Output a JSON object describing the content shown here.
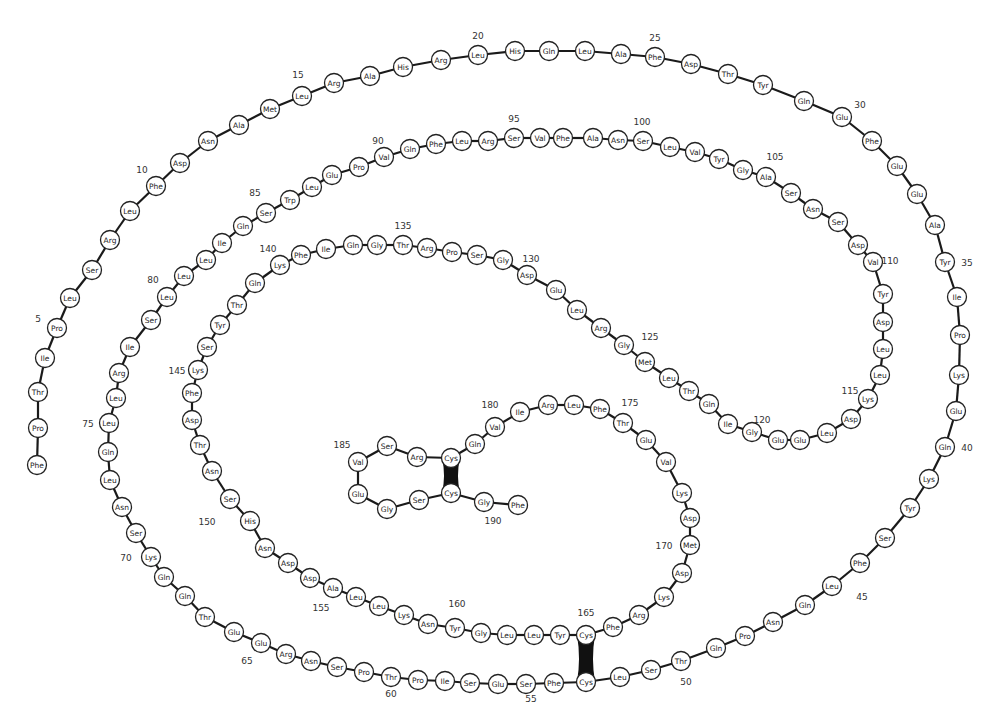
{
  "colors": {
    "ink": "#222222",
    "bond": "#1a1a1a",
    "circle_fill": "#ffffff",
    "disulfide": "#111111"
  },
  "circle_radius": 9.5,
  "residues": [
    {
      "n": 1,
      "aa": "Phe",
      "x": 37,
      "y": 465
    },
    {
      "n": 2,
      "aa": "Pro",
      "x": 38,
      "y": 428
    },
    {
      "n": 3,
      "aa": "Thr",
      "x": 38,
      "y": 392
    },
    {
      "n": 4,
      "aa": "Ile",
      "x": 45,
      "y": 358
    },
    {
      "n": 5,
      "aa": "Pro",
      "x": 57,
      "y": 328
    },
    {
      "n": 6,
      "aa": "Leu",
      "x": 70,
      "y": 298
    },
    {
      "n": 7,
      "aa": "Ser",
      "x": 92,
      "y": 270
    },
    {
      "n": 8,
      "aa": "Arg",
      "x": 110,
      "y": 240
    },
    {
      "n": 9,
      "aa": "Leu",
      "x": 130,
      "y": 211
    },
    {
      "n": 10,
      "aa": "Phe",
      "x": 156,
      "y": 186
    },
    {
      "n": 11,
      "aa": "Asp",
      "x": 180,
      "y": 163
    },
    {
      "n": 12,
      "aa": "Asn",
      "x": 208,
      "y": 141
    },
    {
      "n": 13,
      "aa": "Ala",
      "x": 239,
      "y": 125
    },
    {
      "n": 14,
      "aa": "Met",
      "x": 270,
      "y": 109
    },
    {
      "n": 15,
      "aa": "Leu",
      "x": 302,
      "y": 96
    },
    {
      "n": 16,
      "aa": "Arg",
      "x": 334,
      "y": 83
    },
    {
      "n": 17,
      "aa": "Ala",
      "x": 370,
      "y": 76
    },
    {
      "n": 18,
      "aa": "His",
      "x": 403,
      "y": 67
    },
    {
      "n": 19,
      "aa": "Arg",
      "x": 441,
      "y": 60
    },
    {
      "n": 20,
      "aa": "Leu",
      "x": 478,
      "y": 55
    },
    {
      "n": 21,
      "aa": "His",
      "x": 515,
      "y": 51
    },
    {
      "n": 22,
      "aa": "Gln",
      "x": 549,
      "y": 51
    },
    {
      "n": 23,
      "aa": "Leu",
      "x": 585,
      "y": 51
    },
    {
      "n": 24,
      "aa": "Ala",
      "x": 621,
      "y": 54
    },
    {
      "n": 25,
      "aa": "Phe",
      "x": 655,
      "y": 57
    },
    {
      "n": 26,
      "aa": "Asp",
      "x": 691,
      "y": 64
    },
    {
      "n": 27,
      "aa": "Thr",
      "x": 728,
      "y": 74
    },
    {
      "n": 28,
      "aa": "Tyr",
      "x": 763,
      "y": 85
    },
    {
      "n": 29,
      "aa": "Gln",
      "x": 804,
      "y": 101
    },
    {
      "n": 30,
      "aa": "Glu",
      "x": 842,
      "y": 117
    },
    {
      "n": 31,
      "aa": "Phe",
      "x": 872,
      "y": 141
    },
    {
      "n": 32,
      "aa": "Glu",
      "x": 897,
      "y": 166
    },
    {
      "n": 33,
      "aa": "Glu",
      "x": 917,
      "y": 194
    },
    {
      "n": 34,
      "aa": "Ala",
      "x": 935,
      "y": 225
    },
    {
      "n": 35,
      "aa": "Tyr",
      "x": 945,
      "y": 262
    },
    {
      "n": 36,
      "aa": "Ile",
      "x": 957,
      "y": 297
    },
    {
      "n": 37,
      "aa": "Pro",
      "x": 960,
      "y": 335
    },
    {
      "n": 38,
      "aa": "Lys",
      "x": 959,
      "y": 375
    },
    {
      "n": 39,
      "aa": "Glu",
      "x": 956,
      "y": 411
    },
    {
      "n": 40,
      "aa": "Gln",
      "x": 945,
      "y": 447
    },
    {
      "n": 41,
      "aa": "Lys",
      "x": 929,
      "y": 479
    },
    {
      "n": 42,
      "aa": "Tyr",
      "x": 910,
      "y": 508
    },
    {
      "n": 43,
      "aa": "Ser",
      "x": 885,
      "y": 538
    },
    {
      "n": 44,
      "aa": "Phe",
      "x": 860,
      "y": 563
    },
    {
      "n": 45,
      "aa": "Leu",
      "x": 832,
      "y": 586
    },
    {
      "n": 46,
      "aa": "Gln",
      "x": 805,
      "y": 605
    },
    {
      "n": 47,
      "aa": "Asn",
      "x": 773,
      "y": 622
    },
    {
      "n": 48,
      "aa": "Pro",
      "x": 745,
      "y": 636
    },
    {
      "n": 49,
      "aa": "Gln",
      "x": 716,
      "y": 648
    },
    {
      "n": 50,
      "aa": "Thr",
      "x": 681,
      "y": 661
    },
    {
      "n": 51,
      "aa": "Ser",
      "x": 651,
      "y": 670
    },
    {
      "n": 52,
      "aa": "Leu",
      "x": 620,
      "y": 677
    },
    {
      "n": 53,
      "aa": "Cys",
      "x": 586,
      "y": 682
    },
    {
      "n": 54,
      "aa": "Phe",
      "x": 554,
      "y": 683
    },
    {
      "n": 55,
      "aa": "Ser",
      "x": 526,
      "y": 684
    },
    {
      "n": 56,
      "aa": "Glu",
      "x": 498,
      "y": 684
    },
    {
      "n": 57,
      "aa": "Ser",
      "x": 470,
      "y": 683
    },
    {
      "n": 58,
      "aa": "Ile",
      "x": 445,
      "y": 681
    },
    {
      "n": 59,
      "aa": "Pro",
      "x": 418,
      "y": 680
    },
    {
      "n": 60,
      "aa": "Thr",
      "x": 391,
      "y": 677
    },
    {
      "n": 61,
      "aa": "Pro",
      "x": 364,
      "y": 672
    },
    {
      "n": 62,
      "aa": "Ser",
      "x": 337,
      "y": 667
    },
    {
      "n": 63,
      "aa": "Asn",
      "x": 311,
      "y": 661
    },
    {
      "n": 64,
      "aa": "Arg",
      "x": 286,
      "y": 654
    },
    {
      "n": 65,
      "aa": "Glu",
      "x": 261,
      "y": 643
    },
    {
      "n": 66,
      "aa": "Glu",
      "x": 234,
      "y": 632
    },
    {
      "n": 67,
      "aa": "Thr",
      "x": 205,
      "y": 617
    },
    {
      "n": 68,
      "aa": "Gln",
      "x": 185,
      "y": 596
    },
    {
      "n": 69,
      "aa": "Gln",
      "x": 164,
      "y": 577
    },
    {
      "n": 70,
      "aa": "Lys",
      "x": 151,
      "y": 557
    },
    {
      "n": 71,
      "aa": "Ser",
      "x": 136,
      "y": 533
    },
    {
      "n": 72,
      "aa": "Asn",
      "x": 122,
      "y": 507
    },
    {
      "n": 73,
      "aa": "Leu",
      "x": 110,
      "y": 480
    },
    {
      "n": 74,
      "aa": "Gln",
      "x": 108,
      "y": 452
    },
    {
      "n": 75,
      "aa": "Leu",
      "x": 109,
      "y": 423
    },
    {
      "n": 76,
      "aa": "Leu",
      "x": 116,
      "y": 398
    },
    {
      "n": 77,
      "aa": "Arg",
      "x": 119,
      "y": 373
    },
    {
      "n": 78,
      "aa": "Ile",
      "x": 130,
      "y": 347
    },
    {
      "n": 79,
      "aa": "Ser",
      "x": 151,
      "y": 320
    },
    {
      "n": 80,
      "aa": "Leu",
      "x": 167,
      "y": 297
    },
    {
      "n": 81,
      "aa": "Leu",
      "x": 184,
      "y": 276
    },
    {
      "n": 82,
      "aa": "Leu",
      "x": 206,
      "y": 260
    },
    {
      "n": 83,
      "aa": "Ile",
      "x": 222,
      "y": 243
    },
    {
      "n": 84,
      "aa": "Gln",
      "x": 243,
      "y": 226
    },
    {
      "n": 85,
      "aa": "Ser",
      "x": 266,
      "y": 213
    },
    {
      "n": 86,
      "aa": "Trp",
      "x": 290,
      "y": 200
    },
    {
      "n": 87,
      "aa": "Leu",
      "x": 312,
      "y": 187
    },
    {
      "n": 88,
      "aa": "Glu",
      "x": 332,
      "y": 175
    },
    {
      "n": 89,
      "aa": "Pro",
      "x": 359,
      "y": 167
    },
    {
      "n": 90,
      "aa": "Val",
      "x": 384,
      "y": 157
    },
    {
      "n": 91,
      "aa": "Gln",
      "x": 410,
      "y": 149
    },
    {
      "n": 92,
      "aa": "Phe",
      "x": 436,
      "y": 144
    },
    {
      "n": 93,
      "aa": "Leu",
      "x": 462,
      "y": 141
    },
    {
      "n": 94,
      "aa": "Arg",
      "x": 488,
      "y": 141
    },
    {
      "n": 95,
      "aa": "Ser",
      "x": 514,
      "y": 138
    },
    {
      "n": 96,
      "aa": "Val",
      "x": 540,
      "y": 138
    },
    {
      "n": 97,
      "aa": "Phe",
      "x": 563,
      "y": 138
    },
    {
      "n": 98,
      "aa": "Ala",
      "x": 593,
      "y": 138
    },
    {
      "n": 99,
      "aa": "Asn",
      "x": 618,
      "y": 140
    },
    {
      "n": 100,
      "aa": "Ser",
      "x": 643,
      "y": 141
    },
    {
      "n": 101,
      "aa": "Leu",
      "x": 670,
      "y": 147
    },
    {
      "n": 102,
      "aa": "Val",
      "x": 695,
      "y": 152
    },
    {
      "n": 103,
      "aa": "Tyr",
      "x": 719,
      "y": 159
    },
    {
      "n": 104,
      "aa": "Gly",
      "x": 743,
      "y": 170
    },
    {
      "n": 105,
      "aa": "Ala",
      "x": 766,
      "y": 177
    },
    {
      "n": 106,
      "aa": "Ser",
      "x": 791,
      "y": 193
    },
    {
      "n": 107,
      "aa": "Asn",
      "x": 813,
      "y": 209
    },
    {
      "n": 108,
      "aa": "Ser",
      "x": 838,
      "y": 222
    },
    {
      "n": 109,
      "aa": "Asp",
      "x": 858,
      "y": 245
    },
    {
      "n": 110,
      "aa": "Val",
      "x": 873,
      "y": 262
    },
    {
      "n": 111,
      "aa": "Tyr",
      "x": 883,
      "y": 294
    },
    {
      "n": 112,
      "aa": "Asp",
      "x": 883,
      "y": 322
    },
    {
      "n": 113,
      "aa": "Leu",
      "x": 883,
      "y": 349
    },
    {
      "n": 114,
      "aa": "Leu",
      "x": 880,
      "y": 375
    },
    {
      "n": 115,
      "aa": "Lys",
      "x": 868,
      "y": 399
    },
    {
      "n": 116,
      "aa": "Asp",
      "x": 851,
      "y": 419
    },
    {
      "n": 117,
      "aa": "Leu",
      "x": 827,
      "y": 433
    },
    {
      "n": 118,
      "aa": "Glu",
      "x": 800,
      "y": 440
    },
    {
      "n": 119,
      "aa": "Glu",
      "x": 778,
      "y": 440
    },
    {
      "n": 120,
      "aa": "Gly",
      "x": 752,
      "y": 432
    },
    {
      "n": 121,
      "aa": "Ile",
      "x": 728,
      "y": 424
    },
    {
      "n": 122,
      "aa": "Gln",
      "x": 709,
      "y": 404
    },
    {
      "n": 123,
      "aa": "Thr",
      "x": 689,
      "y": 391
    },
    {
      "n": 124,
      "aa": "Leu",
      "x": 669,
      "y": 378
    },
    {
      "n": 125,
      "aa": "Met",
      "x": 645,
      "y": 362
    },
    {
      "n": 126,
      "aa": "Gly",
      "x": 624,
      "y": 345
    },
    {
      "n": 127,
      "aa": "Arg",
      "x": 601,
      "y": 328
    },
    {
      "n": 128,
      "aa": "Leu",
      "x": 577,
      "y": 310
    },
    {
      "n": 129,
      "aa": "Glu",
      "x": 556,
      "y": 290
    },
    {
      "n": 130,
      "aa": "Asp",
      "x": 527,
      "y": 275
    },
    {
      "n": 131,
      "aa": "Gly",
      "x": 503,
      "y": 260
    },
    {
      "n": 132,
      "aa": "Ser",
      "x": 477,
      "y": 255
    },
    {
      "n": 133,
      "aa": "Pro",
      "x": 452,
      "y": 252
    },
    {
      "n": 134,
      "aa": "Arg",
      "x": 427,
      "y": 248
    },
    {
      "n": 135,
      "aa": "Thr",
      "x": 403,
      "y": 245
    },
    {
      "n": 136,
      "aa": "Gly",
      "x": 377,
      "y": 245
    },
    {
      "n": 137,
      "aa": "Gln",
      "x": 353,
      "y": 245
    },
    {
      "n": 138,
      "aa": "Ile",
      "x": 326,
      "y": 249
    },
    {
      "n": 139,
      "aa": "Phe",
      "x": 301,
      "y": 255
    },
    {
      "n": 140,
      "aa": "Lys",
      "x": 280,
      "y": 265
    },
    {
      "n": 141,
      "aa": "Gln",
      "x": 255,
      "y": 283
    },
    {
      "n": 142,
      "aa": "Thr",
      "x": 237,
      "y": 305
    },
    {
      "n": 143,
      "aa": "Tyr",
      "x": 220,
      "y": 325
    },
    {
      "n": 144,
      "aa": "Ser",
      "x": 207,
      "y": 347
    },
    {
      "n": 145,
      "aa": "Lys",
      "x": 198,
      "y": 370
    },
    {
      "n": 146,
      "aa": "Phe",
      "x": 192,
      "y": 393
    },
    {
      "n": 147,
      "aa": "Asp",
      "x": 192,
      "y": 420
    },
    {
      "n": 148,
      "aa": "Thr",
      "x": 200,
      "y": 445
    },
    {
      "n": 149,
      "aa": "Asn",
      "x": 212,
      "y": 471
    },
    {
      "n": 150,
      "aa": "Ser",
      "x": 230,
      "y": 499
    },
    {
      "n": 151,
      "aa": "His",
      "x": 250,
      "y": 521
    },
    {
      "n": 152,
      "aa": "Asn",
      "x": 265,
      "y": 548
    },
    {
      "n": 153,
      "aa": "Asp",
      "x": 288,
      "y": 563
    },
    {
      "n": 154,
      "aa": "Asp",
      "x": 310,
      "y": 578
    },
    {
      "n": 155,
      "aa": "Ala",
      "x": 333,
      "y": 588
    },
    {
      "n": 156,
      "aa": "Leu",
      "x": 356,
      "y": 597
    },
    {
      "n": 157,
      "aa": "Leu",
      "x": 379,
      "y": 606
    },
    {
      "n": 158,
      "aa": "Lys",
      "x": 404,
      "y": 615
    },
    {
      "n": 159,
      "aa": "Asn",
      "x": 428,
      "y": 624
    },
    {
      "n": 160,
      "aa": "Tyr",
      "x": 455,
      "y": 628
    },
    {
      "n": 161,
      "aa": "Gly",
      "x": 481,
      "y": 633
    },
    {
      "n": 162,
      "aa": "Leu",
      "x": 507,
      "y": 635
    },
    {
      "n": 163,
      "aa": "Leu",
      "x": 534,
      "y": 635
    },
    {
      "n": 164,
      "aa": "Tyr",
      "x": 560,
      "y": 635
    },
    {
      "n": 165,
      "aa": "Cys",
      "x": 586,
      "y": 635
    },
    {
      "n": 166,
      "aa": "Phe",
      "x": 613,
      "y": 627
    },
    {
      "n": 167,
      "aa": "Arg",
      "x": 639,
      "y": 615
    },
    {
      "n": 168,
      "aa": "Lys",
      "x": 664,
      "y": 597
    },
    {
      "n": 169,
      "aa": "Asp",
      "x": 682,
      "y": 573
    },
    {
      "n": 170,
      "aa": "Met",
      "x": 690,
      "y": 545
    },
    {
      "n": 171,
      "aa": "Asp",
      "x": 690,
      "y": 518
    },
    {
      "n": 172,
      "aa": "Lys",
      "x": 682,
      "y": 493
    },
    {
      "n": 173,
      "aa": "Val",
      "x": 666,
      "y": 462
    },
    {
      "n": 174,
      "aa": "Glu",
      "x": 646,
      "y": 440
    },
    {
      "n": 175,
      "aa": "Thr",
      "x": 623,
      "y": 423
    },
    {
      "n": 176,
      "aa": "Phe",
      "x": 600,
      "y": 409
    },
    {
      "n": 177,
      "aa": "Leu",
      "x": 574,
      "y": 405
    },
    {
      "n": 178,
      "aa": "Arg",
      "x": 548,
      "y": 405
    },
    {
      "n": 179,
      "aa": "Ile",
      "x": 520,
      "y": 412
    },
    {
      "n": 180,
      "aa": "Val",
      "x": 495,
      "y": 427
    },
    {
      "n": 181,
      "aa": "Gln",
      "x": 475,
      "y": 444
    },
    {
      "n": 182,
      "aa": "Cys",
      "x": 451,
      "y": 458
    },
    {
      "n": 183,
      "aa": "Arg",
      "x": 417,
      "y": 457
    },
    {
      "n": 184,
      "aa": "Ser",
      "x": 387,
      "y": 446
    },
    {
      "n": 185,
      "aa": "Val",
      "x": 358,
      "y": 462
    },
    {
      "n": 186,
      "aa": "Glu",
      "x": 358,
      "y": 494
    },
    {
      "n": 187,
      "aa": "Gly",
      "x": 387,
      "y": 509
    },
    {
      "n": 188,
      "aa": "Ser",
      "x": 419,
      "y": 500
    },
    {
      "n": 189,
      "aa": "Cys",
      "x": 451,
      "y": 493
    },
    {
      "n": 190,
      "aa": "Gly",
      "x": 484,
      "y": 502
    },
    {
      "n": 191,
      "aa": "Phe",
      "x": 518,
      "y": 505
    }
  ],
  "number_labels": [
    {
      "text": "5",
      "x": 38,
      "y": 322
    },
    {
      "text": "10",
      "x": 142,
      "y": 173
    },
    {
      "text": "15",
      "x": 298,
      "y": 78
    },
    {
      "text": "20",
      "x": 478,
      "y": 39
    },
    {
      "text": "25",
      "x": 655,
      "y": 41
    },
    {
      "text": "30",
      "x": 860,
      "y": 108
    },
    {
      "text": "35",
      "x": 967,
      "y": 266
    },
    {
      "text": "40",
      "x": 967,
      "y": 451
    },
    {
      "text": "45",
      "x": 862,
      "y": 600
    },
    {
      "text": "50",
      "x": 686,
      "y": 685
    },
    {
      "text": "55",
      "x": 531,
      "y": 702
    },
    {
      "text": "60",
      "x": 391,
      "y": 697
    },
    {
      "text": "65",
      "x": 247,
      "y": 664
    },
    {
      "text": "70",
      "x": 126,
      "y": 561
    },
    {
      "text": "75",
      "x": 88,
      "y": 427
    },
    {
      "text": "80",
      "x": 153,
      "y": 283
    },
    {
      "text": "85",
      "x": 255,
      "y": 196
    },
    {
      "text": "90",
      "x": 378,
      "y": 144
    },
    {
      "text": "95",
      "x": 514,
      "y": 122
    },
    {
      "text": "100",
      "x": 642,
      "y": 125
    },
    {
      "text": "105",
      "x": 775,
      "y": 160
    },
    {
      "text": "110",
      "x": 890,
      "y": 264
    },
    {
      "text": "115",
      "x": 850,
      "y": 394
    },
    {
      "text": "120",
      "x": 762,
      "y": 423
    },
    {
      "text": "125",
      "x": 650,
      "y": 340
    },
    {
      "text": "130",
      "x": 531,
      "y": 262
    },
    {
      "text": "135",
      "x": 403,
      "y": 229
    },
    {
      "text": "140",
      "x": 268,
      "y": 252
    },
    {
      "text": "145",
      "x": 177,
      "y": 374
    },
    {
      "text": "150",
      "x": 207,
      "y": 525
    },
    {
      "text": "155",
      "x": 321,
      "y": 611
    },
    {
      "text": "160",
      "x": 457,
      "y": 607
    },
    {
      "text": "165",
      "x": 586,
      "y": 616
    },
    {
      "text": "170",
      "x": 664,
      "y": 549
    },
    {
      "text": "175",
      "x": 630,
      "y": 406
    },
    {
      "text": "180",
      "x": 490,
      "y": 408
    },
    {
      "text": "185",
      "x": 342,
      "y": 448
    },
    {
      "text": "190",
      "x": 493,
      "y": 524
    }
  ],
  "disulfide_bonds": [
    {
      "from": 53,
      "to": 165
    },
    {
      "from": 182,
      "to": 189
    }
  ]
}
